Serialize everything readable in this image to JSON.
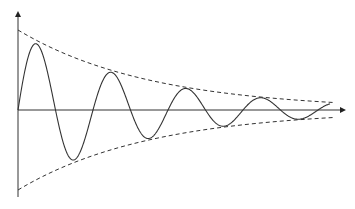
{
  "chart_data": {
    "type": "line",
    "title": "",
    "xlabel": "",
    "ylabel": "",
    "series": [
      {
        "name": "damped-sine",
        "style": "solid",
        "points_px": [
          [
            18,
            110
          ],
          [
            40,
            55
          ],
          [
            77,
            146
          ],
          [
            148,
            92
          ],
          [
            188,
            127
          ],
          [
            203,
            100
          ],
          [
            240,
            121
          ],
          [
            290,
            108
          ],
          [
            330,
            111
          ]
        ]
      },
      {
        "name": "upper-envelope",
        "style": "dashed",
        "points_px": [
          [
            18,
            30
          ],
          [
            335,
            108
          ]
        ]
      },
      {
        "name": "lower-envelope",
        "style": "dashed",
        "points_px": [
          [
            18,
            190
          ],
          [
            335,
            116
          ]
        ]
      }
    ],
    "grid": false,
    "legend": null
  },
  "colors": {
    "line": "#222222",
    "background": "#ffffff"
  }
}
